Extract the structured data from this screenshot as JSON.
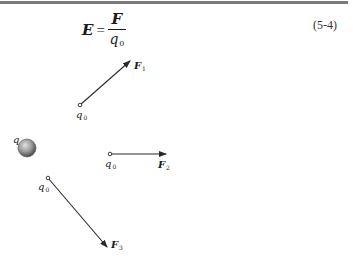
{
  "header": {
    "rule_color": "#7a7a7a"
  },
  "equation": {
    "lhs": "E",
    "equals": "=",
    "numerator": "F",
    "denominator": "q",
    "denominator_subscript": "0",
    "number": "(5-4)"
  },
  "figure": {
    "source_charge": {
      "label": "q",
      "fill_color": "#8a8a8a"
    },
    "test_charges": [
      {
        "label": "q",
        "label_subscript": "0",
        "force_label": "F",
        "force_subscript": "1",
        "direction": "up-right"
      },
      {
        "label": "q",
        "label_subscript": "0",
        "force_label": "F",
        "force_subscript": "2",
        "direction": "right"
      },
      {
        "label": "q",
        "label_subscript": "0",
        "force_label": "F",
        "force_subscript": "3",
        "direction": "down-right"
      }
    ],
    "line_color": "#2a2a2a"
  }
}
